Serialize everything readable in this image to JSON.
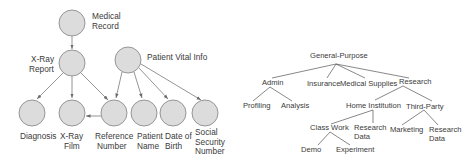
{
  "left_diagram": {
    "nodes": [
      {
        "id": "medical_record",
        "label_lines": [
          "Medical",
          "Record"
        ],
        "cx": 72,
        "cy": 23
      },
      {
        "id": "xray_report",
        "label_lines": [
          "X-Ray",
          "Report"
        ],
        "cx": 72,
        "cy": 63
      },
      {
        "id": "patient_vital_info",
        "label_lines": [
          "Patient Vital Info"
        ],
        "cx": 128,
        "cy": 60
      },
      {
        "id": "diagnosis",
        "label_lines": [
          "Diagnosis"
        ],
        "cx": 32,
        "cy": 112
      },
      {
        "id": "xray_film",
        "label_lines": [
          "X-Ray",
          "Film"
        ],
        "cx": 72,
        "cy": 112
      },
      {
        "id": "reference_number",
        "label_lines": [
          "Reference",
          "Number"
        ],
        "cx": 114,
        "cy": 112
      },
      {
        "id": "patient_name",
        "label_lines": [
          "Patient",
          "Name"
        ],
        "cx": 144,
        "cy": 112
      },
      {
        "id": "date_of_birth",
        "label_lines": [
          "Date of",
          "Birth"
        ],
        "cx": 173,
        "cy": 112
      },
      {
        "id": "social_security_number",
        "label_lines": [
          "Social",
          "Security",
          "Number"
        ],
        "cx": 206,
        "cy": 112
      }
    ],
    "edges": [
      [
        "medical_record",
        "xray_report"
      ],
      [
        "xray_report",
        "diagnosis"
      ],
      [
        "xray_report",
        "xray_film"
      ],
      [
        "xray_report",
        "reference_number"
      ],
      [
        "patient_vital_info",
        "reference_number"
      ],
      [
        "patient_vital_info",
        "patient_name"
      ],
      [
        "patient_vital_info",
        "date_of_birth"
      ],
      [
        "patient_vital_info",
        "social_security_number"
      ],
      [
        "reference_number",
        "xray_film"
      ]
    ]
  },
  "right_tree": {
    "nodes": [
      {
        "id": "general_purpose",
        "label_lines": [
          "General-Purpose"
        ]
      },
      {
        "id": "admin",
        "label_lines": [
          "Admin"
        ]
      },
      {
        "id": "insurance",
        "label_lines": [
          "Insurance"
        ]
      },
      {
        "id": "medical_supplies",
        "label_lines": [
          "Medical Supplies"
        ]
      },
      {
        "id": "research",
        "label_lines": [
          "Research"
        ]
      },
      {
        "id": "profiling",
        "label_lines": [
          "Profiling"
        ]
      },
      {
        "id": "analysis",
        "label_lines": [
          "Analysis"
        ]
      },
      {
        "id": "home_institution",
        "label_lines": [
          "Home Institution"
        ]
      },
      {
        "id": "third_party",
        "label_lines": [
          "Third-Party"
        ]
      },
      {
        "id": "class_work",
        "label_lines": [
          "Class Work"
        ]
      },
      {
        "id": "research_data_home",
        "label_lines": [
          "Research",
          "Data"
        ]
      },
      {
        "id": "marketing",
        "label_lines": [
          "Marketing"
        ]
      },
      {
        "id": "research_data_third",
        "label_lines": [
          "Research",
          "Data"
        ]
      },
      {
        "id": "demo",
        "label_lines": [
          "Demo"
        ]
      },
      {
        "id": "experiment",
        "label_lines": [
          "Experiment"
        ]
      }
    ],
    "edges": [
      [
        "general_purpose",
        "admin"
      ],
      [
        "general_purpose",
        "insurance"
      ],
      [
        "general_purpose",
        "medical_supplies"
      ],
      [
        "general_purpose",
        "research"
      ],
      [
        "admin",
        "profiling"
      ],
      [
        "admin",
        "analysis"
      ],
      [
        "research",
        "home_institution"
      ],
      [
        "research",
        "third_party"
      ],
      [
        "home_institution",
        "class_work"
      ],
      [
        "home_institution",
        "research_data_home"
      ],
      [
        "third_party",
        "marketing"
      ],
      [
        "third_party",
        "research_data_third"
      ],
      [
        "class_work",
        "demo"
      ],
      [
        "class_work",
        "experiment"
      ]
    ]
  }
}
